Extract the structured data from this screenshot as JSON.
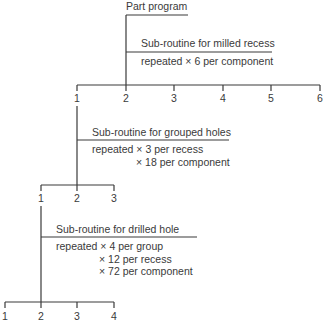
{
  "diagram": {
    "type": "hierarchy",
    "root": {
      "label": "Part program"
    },
    "levels": [
      {
        "title": "Sub-routine for milled recess",
        "repeat_lines": [
          "repeated × 6 per component"
        ],
        "children": [
          "1",
          "2",
          "3",
          "4",
          "5",
          "6"
        ]
      },
      {
        "title": "Sub-routine for grouped holes",
        "repeat_lines": [
          "repeated × 3 per recess",
          "× 18 per component"
        ],
        "children": [
          "1",
          "2",
          "3"
        ]
      },
      {
        "title": "Sub-routine for drilled hole",
        "repeat_lines": [
          "repeated × 4 per group",
          "× 12 per recess",
          "× 72 per component"
        ],
        "children": [
          "1",
          "2",
          "3",
          "4"
        ]
      }
    ],
    "line_color": "#3a3a3a",
    "text_color": "#3a3a3a"
  }
}
